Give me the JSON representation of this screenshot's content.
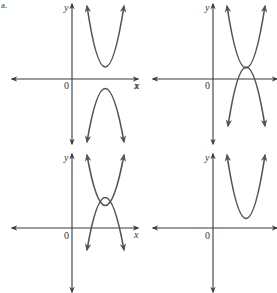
{
  "figure": {
    "part_label": "a.",
    "panels": [
      {
        "id": "top-left",
        "x_label": "x",
        "y_label": "y",
        "origin_label": "0",
        "curves": [
          {
            "shape": "parabola-up",
            "vertex_region": "above x-axis, right of y-axis"
          },
          {
            "shape": "parabola-down",
            "vertex_region": "below x-axis, right of y-axis"
          }
        ],
        "intersections": 0
      },
      {
        "id": "top-right",
        "x_label": "x",
        "y_label": "y",
        "origin_label": "0",
        "curves": [
          {
            "shape": "parabola-up",
            "vertex_region": "slightly above x-axis, right of y-axis"
          },
          {
            "shape": "parabola-down",
            "vertex_region": "slightly above x-axis, right of y-axis"
          }
        ],
        "intersections": 1
      },
      {
        "id": "bottom-left",
        "x_label": "x",
        "y_label": "y",
        "origin_label": "0",
        "curves": [
          {
            "shape": "parabola-up",
            "vertex_region": "above x-axis, right of y-axis"
          },
          {
            "shape": "parabola-down",
            "vertex_region": "above x-axis, right of y-axis"
          }
        ],
        "intersections": 2
      },
      {
        "id": "bottom-right",
        "x_label": "x",
        "y_label": "y",
        "origin_label": "0",
        "curves": [
          {
            "shape": "parabola-up",
            "vertex_region": "above x-axis, right of y-axis"
          }
        ],
        "intersections": 0
      }
    ]
  },
  "colors": {
    "axis": "#3a3a3a",
    "curve": "#555555",
    "background": "#ffffff"
  }
}
